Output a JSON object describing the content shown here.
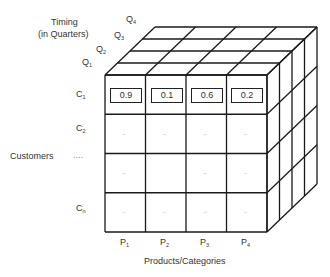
{
  "diagram": {
    "type": "data-cube",
    "axes": {
      "timing": {
        "title_line1": "Timing",
        "title_line2": "(in Quarters)",
        "ticks": [
          {
            "base": "Q",
            "sub": "1"
          },
          {
            "base": "Q",
            "sub": "2"
          },
          {
            "base": "Q",
            "sub": "3"
          },
          {
            "base": "Q",
            "sub": "4"
          }
        ]
      },
      "customers": {
        "title": "Customers",
        "ellipsis": "....",
        "ticks": [
          {
            "base": "C",
            "sub": "1"
          },
          {
            "base": "C",
            "sub": "2"
          },
          {
            "base": "C",
            "sub": "n"
          }
        ]
      },
      "products": {
        "title": "Products/Categories",
        "ticks": [
          {
            "base": "P",
            "sub": "1"
          },
          {
            "base": "P",
            "sub": "2"
          },
          {
            "base": "P",
            "sub": "3"
          },
          {
            "base": "P",
            "sub": "4"
          }
        ]
      }
    },
    "front_face": {
      "row_c1_values": [
        "0.9",
        "0.1",
        "0.6",
        "0.2"
      ],
      "placeholder": ".."
    },
    "colors": {
      "line": "#1a1a1a",
      "text": "#333333",
      "placeholder": "#aaaaaa"
    }
  }
}
